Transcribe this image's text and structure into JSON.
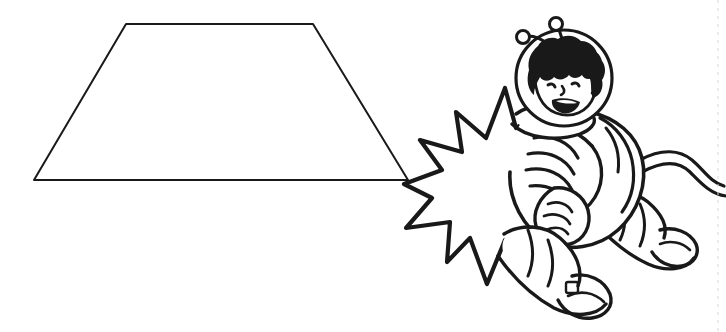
{
  "page": {
    "width": 726,
    "height": 332,
    "background_color": "#ffffff",
    "ink_color": "#191919",
    "style": "black and white coloring-page line art",
    "text_content": "none"
  },
  "figures": {
    "trapezoid": {
      "name": "trapezoid",
      "description": "Isosceles trapezoid outline, wider at the bottom",
      "stroke_color": "#191919",
      "stroke_width": 2,
      "fill": "none",
      "vertices": [
        {
          "label": "top-left",
          "x": 126,
          "y": 24
        },
        {
          "label": "top-right",
          "x": 313,
          "y": 24
        },
        {
          "label": "bottom-right",
          "x": 408,
          "y": 180
        },
        {
          "label": "bottom-left",
          "x": 34,
          "y": 180
        }
      ],
      "top_width": 187,
      "bottom_width": 374,
      "height": 156
    },
    "starburst": {
      "name": "starburst-burst",
      "description": "Jagged comic explosion / burst shape behind the astronaut",
      "stroke_color": "#191919",
      "stroke_width": 4,
      "fill": "#ffffff",
      "bounds": {
        "x": 404,
        "y": 84,
        "width": 186,
        "height": 200
      },
      "points": 11
    },
    "astronaut": {
      "name": "astronaut-child",
      "description": "Cartoon child in a spacesuit with a bubble helmet, floating",
      "stroke_color": "#191919",
      "fill": "#ffffff",
      "bounds": {
        "x": 470,
        "y": 14,
        "width": 256,
        "height": 318
      },
      "parts": [
        {
          "name": "helmet-bubble",
          "cx": 564,
          "cy": 78,
          "r": 48
        },
        {
          "name": "antenna-left",
          "ball": {
            "cx": 523,
            "cy": 37,
            "r": 6
          }
        },
        {
          "name": "antenna-right",
          "ball": {
            "cx": 556,
            "cy": 24,
            "r": 6
          }
        },
        {
          "name": "curly-hair",
          "description": "tight curly hair fringe around the face"
        },
        {
          "name": "face",
          "features": [
            "left-eye",
            "right-eye",
            "nose",
            "smiling-open-mouth",
            "ear"
          ]
        },
        {
          "name": "neck-collar"
        },
        {
          "name": "torso-suit",
          "description": "ribbed spacesuit torso"
        },
        {
          "name": "left-arm-ribbed"
        },
        {
          "name": "right-arm-ribbed"
        },
        {
          "name": "glove-hand",
          "cx": 573,
          "cy": 212
        },
        {
          "name": "left-leg-ribbed"
        },
        {
          "name": "right-leg-ribbed"
        },
        {
          "name": "boot-front",
          "cx": 571,
          "cy": 283
        },
        {
          "name": "boot-back",
          "cx": 654,
          "cy": 237
        },
        {
          "name": "tether-cord",
          "description": "wavy double-line umbilical cord running off the right edge"
        }
      ]
    },
    "edge_marker": {
      "name": "page-edge-dashed-guide",
      "description": "Faint vertical dashed trim guide near the right edge",
      "x": 718,
      "color": "#d8d8d8"
    }
  }
}
